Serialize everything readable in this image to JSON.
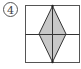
{
  "figure": {
    "label": "4",
    "colors": {
      "stroke": "#333333",
      "fill": "#c8c8c8",
      "background": "#ffffff"
    },
    "square": {
      "x": 25,
      "y": 5,
      "width": 54,
      "height": 58
    },
    "diamond": {
      "top": [
        52,
        6
      ],
      "right": [
        66,
        34
      ],
      "bottom": [
        52,
        62
      ],
      "left": [
        39,
        34
      ]
    }
  }
}
